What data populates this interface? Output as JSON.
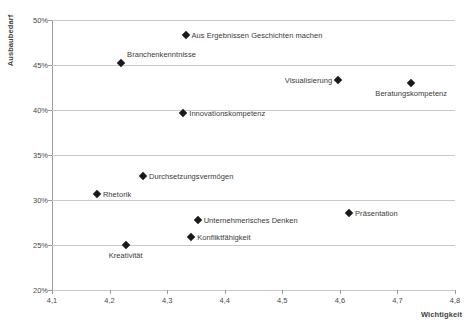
{
  "chart_data": {
    "type": "scatter",
    "title": "",
    "xlabel": "Wichtigkeit",
    "ylabel": "Ausbaubedarf",
    "xlim": [
      4.1,
      4.8
    ],
    "ylim": [
      0.2,
      0.5
    ],
    "xticks": [
      "4,1",
      "4,2",
      "4,3",
      "4,4",
      "4,5",
      "4,6",
      "4,7",
      "4,8"
    ],
    "xtick_values": [
      4.1,
      4.2,
      4.3,
      4.4,
      4.5,
      4.6,
      4.7,
      4.8
    ],
    "yticks": [
      "20%",
      "25%",
      "30%",
      "35%",
      "40%",
      "45%",
      "50%"
    ],
    "ytick_values": [
      0.2,
      0.25,
      0.3,
      0.35,
      0.4,
      0.45,
      0.5
    ],
    "grid": "horizontal",
    "legend": "none",
    "marker": "diamond",
    "marker_color": "#1a1a1a",
    "grid_color": "#c8c8c8",
    "axis_color": "#9a9a9a",
    "points": [
      {
        "label": "Aus Ergebnissen Geschichten machen",
        "x": 4.332,
        "y": 0.4833,
        "label_pos": "right"
      },
      {
        "label": "Branchenkenntnisse",
        "x": 4.22,
        "y": 0.4522,
        "label_pos": "right-above"
      },
      {
        "label": "Visualisierung",
        "x": 4.597,
        "y": 0.4333,
        "label_pos": "left"
      },
      {
        "label": "Beratungskompetenz",
        "x": 4.724,
        "y": 0.43,
        "label_pos": "below"
      },
      {
        "label": "Innovationskompetenz",
        "x": 4.328,
        "y": 0.3967,
        "label_pos": "right"
      },
      {
        "label": "Durchsetzungsvermögen",
        "x": 4.258,
        "y": 0.3272,
        "label_pos": "right"
      },
      {
        "label": "Rhetorik",
        "x": 4.178,
        "y": 0.3067,
        "label_pos": "right"
      },
      {
        "label": "Präsentation",
        "x": 4.616,
        "y": 0.2861,
        "label_pos": "right"
      },
      {
        "label": "Unternehmerisches Denken",
        "x": 4.353,
        "y": 0.2783,
        "label_pos": "right"
      },
      {
        "label": "Konfliktfähigkeit",
        "x": 4.342,
        "y": 0.2589,
        "label_pos": "right"
      },
      {
        "label": "Kreativität",
        "x": 4.228,
        "y": 0.25,
        "label_pos": "below"
      }
    ]
  }
}
